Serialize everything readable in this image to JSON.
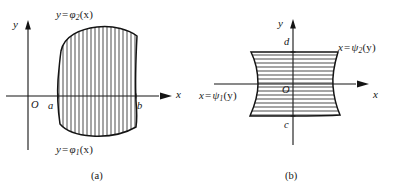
{
  "figure": {
    "background_color": "#ffffff",
    "ink_color": "#1a1a1a",
    "panels": [
      {
        "id": "a",
        "caption": "(a)",
        "region_type": "x-type",
        "hatching": "vertical",
        "axes": {
          "x_label": "x",
          "y_label": "y",
          "origin_label": "O"
        },
        "bounds": {
          "left_label": "a",
          "right_label": "b"
        },
        "curves": {
          "upper": {
            "text_y": "y",
            "text_eq": "=",
            "text_fn": "φ",
            "text_sub": "2",
            "text_arg": "(x)",
            "full": "y = φ₂(x)"
          },
          "lower": {
            "text_y": "y",
            "text_eq": "=",
            "text_fn": "φ",
            "text_sub": "1",
            "text_arg": "(x)",
            "full": "y = φ₁(x)"
          }
        }
      },
      {
        "id": "b",
        "caption": "(b)",
        "region_type": "y-type",
        "hatching": "horizontal",
        "axes": {
          "x_label": "x",
          "y_label": "y",
          "origin_label": "O"
        },
        "bounds": {
          "top_label": "d",
          "bottom_label": "c"
        },
        "curves": {
          "right": {
            "text_x": "x",
            "text_eq": "=",
            "text_fn": "ψ",
            "text_sub": "2",
            "text_arg": "(y)",
            "full": "x = ψ₂(y)"
          },
          "left": {
            "text_x": "x",
            "text_eq": "=",
            "text_fn": "ψ",
            "text_sub": "1",
            "text_arg": "(y)",
            "full": "x = ψ₁(y)"
          }
        }
      }
    ]
  }
}
